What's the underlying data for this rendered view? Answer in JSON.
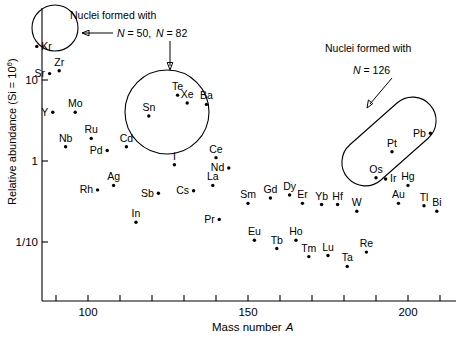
{
  "figure": {
    "name": "solar-system-abundance-vs-mass-number"
  },
  "axes": {
    "x": {
      "title_main": "Mass number",
      "title_italic": "A",
      "ticks": [
        {
          "value": 90,
          "label": ""
        },
        {
          "value": 100,
          "label": "100"
        },
        {
          "value": 110,
          "label": ""
        },
        {
          "value": 120,
          "label": ""
        },
        {
          "value": 130,
          "label": ""
        },
        {
          "value": 140,
          "label": ""
        },
        {
          "value": 150,
          "label": "150"
        },
        {
          "value": 160,
          "label": ""
        },
        {
          "value": 170,
          "label": ""
        },
        {
          "value": 180,
          "label": ""
        },
        {
          "value": 190,
          "label": ""
        },
        {
          "value": 200,
          "label": "200"
        },
        {
          "value": 210,
          "label": ""
        }
      ],
      "range": [
        85,
        215
      ]
    },
    "y": {
      "title_main": "Relative abundance (Si = 10",
      "title_sup": "6",
      "title_close": ")",
      "ticks": [
        {
          "value": 10,
          "label": "10"
        },
        {
          "value": 1,
          "label": "1"
        },
        {
          "value": 0.1,
          "label": "1/10"
        }
      ],
      "range": [
        0.025,
        40
      ],
      "scale": "log"
    }
  },
  "chart_data": {
    "type": "scatter",
    "title": "",
    "xlabel": "Mass number A",
    "ylabel": "Relative abundance (Si = 10^6)",
    "xlim": [
      85,
      215
    ],
    "ylim": [
      0.025,
      40
    ],
    "yscale": "log",
    "grid": false,
    "legend": "none",
    "points": [
      {
        "label": "Kr",
        "A": 84,
        "abundance": 26.0,
        "label_pos": "right"
      },
      {
        "label": "Sr",
        "A": 88,
        "abundance": 12.0,
        "label_pos": "left"
      },
      {
        "label": "Zr",
        "A": 91,
        "abundance": 13.0,
        "label_pos": "above"
      },
      {
        "label": "Y",
        "A": 89,
        "abundance": 4.0,
        "label_pos": "left"
      },
      {
        "label": "Mo",
        "A": 96,
        "abundance": 4.0,
        "label_pos": "above"
      },
      {
        "label": "Nb",
        "A": 93,
        "abundance": 1.5,
        "label_pos": "above"
      },
      {
        "label": "Ru",
        "A": 101,
        "abundance": 1.9,
        "label_pos": "above"
      },
      {
        "label": "Pd",
        "A": 106,
        "abundance": 1.35,
        "label_pos": "left"
      },
      {
        "label": "Cd",
        "A": 112,
        "abundance": 1.5,
        "label_pos": "above"
      },
      {
        "label": "Ag",
        "A": 108,
        "abundance": 0.5,
        "label_pos": "above"
      },
      {
        "label": "Rh",
        "A": 103,
        "abundance": 0.44,
        "label_pos": "left"
      },
      {
        "label": "In",
        "A": 115,
        "abundance": 0.175,
        "label_pos": "above"
      },
      {
        "label": "Sb",
        "A": 122,
        "abundance": 0.4,
        "label_pos": "left"
      },
      {
        "label": "Sn",
        "A": 119,
        "abundance": 3.6,
        "label_pos": "above"
      },
      {
        "label": "Te",
        "A": 128,
        "abundance": 6.5,
        "label_pos": "above"
      },
      {
        "label": "Xe",
        "A": 131,
        "abundance": 5.2,
        "label_pos": "above"
      },
      {
        "label": "Ba",
        "A": 137,
        "abundance": 5.0,
        "label_pos": "above"
      },
      {
        "label": "I",
        "A": 127,
        "abundance": 0.9,
        "label_pos": "above"
      },
      {
        "label": "Cs",
        "A": 133,
        "abundance": 0.43,
        "label_pos": "left"
      },
      {
        "label": "Ce",
        "A": 140,
        "abundance": 1.1,
        "label_pos": "above"
      },
      {
        "label": "Nd",
        "A": 144,
        "abundance": 0.82,
        "label_pos": "left"
      },
      {
        "label": "La",
        "A": 139,
        "abundance": 0.5,
        "label_pos": "above"
      },
      {
        "label": "Pr",
        "A": 141,
        "abundance": 0.19,
        "label_pos": "left"
      },
      {
        "label": "Sm",
        "A": 150,
        "abundance": 0.3,
        "label_pos": "above"
      },
      {
        "label": "Eu",
        "A": 152,
        "abundance": 0.105,
        "label_pos": "above"
      },
      {
        "label": "Gd",
        "A": 157,
        "abundance": 0.35,
        "label_pos": "above"
      },
      {
        "label": "Tb",
        "A": 159,
        "abundance": 0.083,
        "label_pos": "above"
      },
      {
        "label": "Dy",
        "A": 163,
        "abundance": 0.38,
        "label_pos": "above"
      },
      {
        "label": "Ho",
        "A": 165,
        "abundance": 0.105,
        "label_pos": "above"
      },
      {
        "label": "Er",
        "A": 167,
        "abundance": 0.3,
        "label_pos": "above"
      },
      {
        "label": "Tm",
        "A": 169,
        "abundance": 0.066,
        "label_pos": "above"
      },
      {
        "label": "Yb",
        "A": 173,
        "abundance": 0.29,
        "label_pos": "above"
      },
      {
        "label": "Lu",
        "A": 175,
        "abundance": 0.068,
        "label_pos": "above"
      },
      {
        "label": "Hf",
        "A": 178,
        "abundance": 0.29,
        "label_pos": "above"
      },
      {
        "label": "Ta",
        "A": 181,
        "abundance": 0.05,
        "label_pos": "above"
      },
      {
        "label": "W",
        "A": 184,
        "abundance": 0.24,
        "label_pos": "above"
      },
      {
        "label": "Re",
        "A": 187,
        "abundance": 0.075,
        "label_pos": "above"
      },
      {
        "label": "Os",
        "A": 190,
        "abundance": 0.62,
        "label_pos": "above"
      },
      {
        "label": "Ir",
        "A": 193,
        "abundance": 0.6,
        "label_pos": "right"
      },
      {
        "label": "Pt",
        "A": 195,
        "abundance": 1.3,
        "label_pos": "above"
      },
      {
        "label": "Au",
        "A": 197,
        "abundance": 0.3,
        "label_pos": "above"
      },
      {
        "label": "Hg",
        "A": 200,
        "abundance": 0.5,
        "label_pos": "above"
      },
      {
        "label": "Tl",
        "A": 205,
        "abundance": 0.28,
        "label_pos": "above"
      },
      {
        "label": "Pb",
        "A": 207,
        "abundance": 2.2,
        "label_pos": "left"
      },
      {
        "label": "Bi",
        "A": 209,
        "abundance": 0.24,
        "label_pos": "above"
      }
    ],
    "annotations": [
      {
        "id": "magic-50",
        "text_line1": "Nuclei formed with",
        "text_line2_italic": "N",
        "text_line2_rest": " = 50,",
        "shape": "circle",
        "encircles": [
          "Kr",
          "Sr",
          "Zr"
        ]
      },
      {
        "id": "magic-82",
        "text_line2_italic": "N",
        "text_line2_rest": " = 82",
        "shape": "circle",
        "encircles": [
          "Sn",
          "Te",
          "Xe",
          "Ba"
        ]
      },
      {
        "id": "magic-126",
        "text_line1": "Nuclei formed with",
        "text_line2_italic": "N",
        "text_line2_rest": " = 126",
        "shape": "capsule",
        "encircles": [
          "Os",
          "Ir",
          "Pt",
          "Pb"
        ]
      }
    ]
  }
}
